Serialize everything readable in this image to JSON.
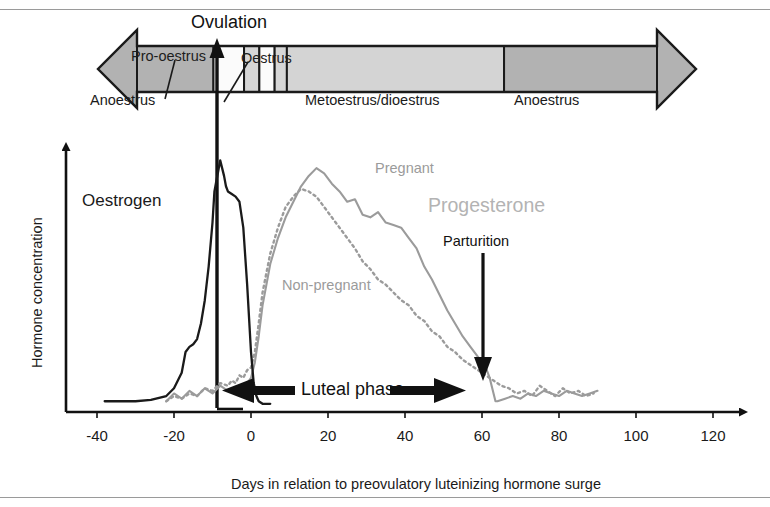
{
  "figure": {
    "background_color": "#ffffff",
    "frame_rule_color": "#9a9a9a"
  },
  "cycle_bar": {
    "ovulation_label": "Ovulation",
    "pro_oestrus_callout": "Pro-oestrus",
    "oestrus_callout": "Oestrus",
    "arrow_fill": "#b2b2b2",
    "arrow_stroke": "#1a1a1a",
    "segments": [
      {
        "label": "Anoestrus",
        "fill": "#b2b2b2",
        "start_day": -45,
        "end_day": -20
      },
      {
        "label": "",
        "fill": "#fbfbfb",
        "start_day": -20,
        "end_day": -10
      },
      {
        "label": "",
        "fill": "#d6d6d6",
        "start_day": -10,
        "end_day": -5
      },
      {
        "label": "",
        "fill": "#fbfbfb",
        "start_day": -5,
        "end_day": 0
      },
      {
        "label": "",
        "fill": "#d6d6d6",
        "start_day": 0,
        "end_day": 4
      },
      {
        "label": "Metoestrus/dioestrus",
        "fill": "#d4d4d4",
        "start_day": 4,
        "end_day": 75
      },
      {
        "label": "Anoestrus",
        "fill": "#b2b2b2",
        "start_day": 75,
        "end_day": 125
      }
    ]
  },
  "annotations": {
    "oestrogen": "Oestrogen",
    "progesterone": "Progesterone",
    "pregnant": "Pregnant",
    "non_pregnant": "Non-pregnant",
    "parturition": "Parturition",
    "luteal_phase": "Luteal phase"
  },
  "axes": {
    "x_title": "Days in relation to preovulatory luteinizing hormone surge",
    "y_title": "Hormone concentration",
    "x_ticks": [
      "-40",
      "-20",
      "0",
      "20",
      "40",
      "60",
      "80",
      "100",
      "120"
    ],
    "x_tick_values": [
      -40,
      -20,
      0,
      20,
      40,
      60,
      80,
      100,
      120
    ]
  },
  "chart_data": {
    "type": "line",
    "title": "",
    "xlabel": "Days in relation to preovulatory luteinizing hormone surge",
    "ylabel": "Hormone concentration",
    "xlim": [
      -45,
      128
    ],
    "ylim": [
      0,
      100
    ],
    "grid": false,
    "legend": "inline-annotations",
    "annotations": [
      {
        "text": "Ovulation",
        "day": 0,
        "kind": "vertical-line-with-up-arrow"
      },
      {
        "text": "Parturition",
        "day": 63,
        "kind": "down-arrow"
      },
      {
        "text": "Luteal phase",
        "from_day": 1,
        "to_day": 63,
        "kind": "double-arrow"
      }
    ],
    "series": [
      {
        "name": "Oestrogen",
        "color": "#1a1a1a",
        "style": "solid",
        "x": [
          -38,
          -34,
          -30,
          -26,
          -22,
          -20,
          -18,
          -17,
          -16,
          -15,
          -14,
          -13,
          -12,
          -11,
          -10,
          -9.5,
          -9,
          -8.5,
          -8,
          -7.5,
          -7,
          -6.5,
          -6,
          -5,
          -4,
          -3,
          -2,
          -1,
          0,
          0.7,
          1.4,
          2,
          3,
          5
        ],
        "y": [
          3,
          3,
          3,
          3.5,
          5,
          8,
          14,
          22,
          24,
          25,
          27,
          33,
          42,
          55,
          72,
          84,
          88,
          92,
          96,
          93,
          90,
          86,
          84,
          83,
          82,
          80,
          70,
          48,
          22,
          10,
          5,
          3,
          2,
          2
        ]
      },
      {
        "name": "Progesterone, pregnant",
        "color": "#9b9b9b",
        "style": "solid",
        "x": [
          -22,
          -20,
          -18,
          -16,
          -14,
          -12,
          -10,
          -8,
          -6,
          -5,
          -4,
          -3,
          -2,
          -1,
          0,
          1,
          2,
          3,
          5,
          7,
          9,
          11,
          13,
          15,
          17,
          19,
          21,
          23,
          25,
          27,
          29,
          31,
          33,
          35,
          37,
          39,
          41,
          43,
          45,
          47,
          49,
          51,
          53,
          55,
          57,
          59,
          61,
          62,
          63,
          63.5,
          64,
          66,
          68,
          70,
          72,
          74,
          76,
          78,
          80,
          82,
          84,
          86,
          88,
          90
        ],
        "y": [
          3,
          6,
          4,
          7,
          5,
          8,
          6,
          9,
          7,
          8,
          6,
          9,
          8,
          10,
          12,
          18,
          28,
          40,
          56,
          66,
          74,
          80,
          86,
          90,
          93,
          91,
          87,
          84,
          80,
          81,
          75,
          74,
          76,
          72,
          71,
          70,
          66,
          62,
          55,
          50,
          44,
          38,
          33,
          28,
          24,
          20,
          16,
          12,
          6,
          3,
          3,
          4,
          5,
          4,
          6,
          5,
          7,
          6,
          5,
          7,
          6,
          5,
          6,
          7
        ]
      },
      {
        "name": "Progesterone, non-pregnant",
        "color": "#9b9b9b",
        "style": "dotted",
        "x": [
          -22,
          -20,
          -18,
          -16,
          -14,
          -12,
          -10,
          -8,
          -6,
          -5,
          -4,
          -3,
          -2,
          -1,
          0,
          1,
          2,
          3,
          5,
          7,
          9,
          11,
          13,
          15,
          17,
          19,
          21,
          23,
          25,
          27,
          29,
          31,
          33,
          35,
          37,
          39,
          41,
          43,
          45,
          47,
          49,
          51,
          53,
          55,
          57,
          59,
          61,
          63,
          65,
          67,
          69,
          71,
          73,
          75,
          77,
          79,
          81,
          83,
          85,
          87,
          89
        ],
        "y": [
          3,
          5,
          4,
          6,
          5,
          8,
          7,
          10,
          9,
          11,
          10,
          13,
          12,
          15,
          16,
          22,
          33,
          45,
          60,
          70,
          78,
          82,
          85,
          84,
          82,
          78,
          74,
          70,
          66,
          62,
          57,
          54,
          50,
          48,
          45,
          42,
          40,
          36,
          34,
          30,
          28,
          24,
          22,
          19,
          17,
          15,
          13,
          11,
          9,
          8,
          6,
          7,
          5,
          9,
          7,
          5,
          8,
          6,
          7,
          5,
          6
        ]
      }
    ]
  }
}
